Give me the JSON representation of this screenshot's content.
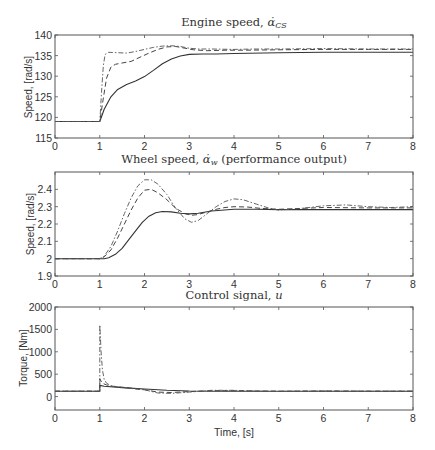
{
  "figure": {
    "xlabel": "Time, [s]"
  },
  "chart_data": [
    {
      "type": "line",
      "title": "Engine speed, α̇_CS",
      "title_main": "Engine speed, ",
      "title_symbol": "α̇",
      "title_sub": "CS",
      "xlabel": "",
      "ylabel": "Speed, [rad/s]",
      "xlim": [
        0,
        8
      ],
      "ylim": [
        115,
        140
      ],
      "xticks": [
        0,
        1,
        2,
        3,
        4,
        5,
        6,
        7,
        8
      ],
      "yticks": [
        115,
        120,
        125,
        130,
        135,
        140
      ],
      "grid": false,
      "legend": "none",
      "series": [
        {
          "name": "solid",
          "style": "solid",
          "x": [
            0,
            1.0,
            1.1,
            1.25,
            1.4,
            1.6,
            1.8,
            2.0,
            2.2,
            2.4,
            2.6,
            2.8,
            3.0,
            3.3,
            3.6,
            4.0,
            5.0,
            6.0,
            7.0,
            8.0
          ],
          "y": [
            119,
            119,
            122,
            125,
            126.8,
            128,
            128.8,
            129.9,
            131.4,
            133.0,
            134.2,
            134.9,
            135.3,
            135.4,
            135.4,
            135.5,
            135.7,
            135.8,
            135.8,
            135.8
          ]
        },
        {
          "name": "dashed",
          "style": "dashed",
          "x": [
            0,
            1.0,
            1.07,
            1.15,
            1.25,
            1.35,
            1.5,
            1.7,
            1.9,
            2.1,
            2.3,
            2.5,
            2.7,
            2.9,
            3.1,
            3.4,
            3.8,
            4.2,
            5.0,
            6.0,
            7.0,
            8.0
          ],
          "y": [
            119,
            119,
            124,
            129.5,
            132.2,
            132.9,
            133.2,
            133.6,
            134.6,
            135.6,
            136.5,
            137.1,
            137.2,
            136.8,
            136.4,
            136.2,
            136.3,
            136.3,
            136.4,
            136.5,
            136.5,
            136.5
          ]
        },
        {
          "name": "dash-dot",
          "style": "dashdot",
          "x": [
            0,
            1.0,
            1.04,
            1.08,
            1.12,
            1.2,
            1.4,
            1.6,
            1.8,
            2.0,
            2.2,
            2.4,
            2.6,
            2.8,
            3.0,
            3.2,
            3.5,
            4.0,
            4.5,
            5.0,
            6.0,
            7.0,
            8.0
          ],
          "y": [
            119,
            119,
            126,
            132.5,
            135.3,
            135.8,
            135.7,
            135.6,
            136.0,
            136.5,
            137.0,
            137.3,
            137.4,
            137.2,
            136.8,
            136.6,
            136.6,
            136.5,
            136.6,
            136.6,
            136.7,
            136.6,
            136.6
          ]
        }
      ]
    },
    {
      "type": "line",
      "title": "Wheel speed, α̇_w (performance output)",
      "title_main": "Wheel speed, ",
      "title_symbol": "α̇",
      "title_sub": "w",
      "title_tail": " (performance output)",
      "xlabel": "",
      "ylabel": "Speed, [rad/s]",
      "xlim": [
        0,
        8
      ],
      "ylim": [
        1.9,
        2.5
      ],
      "xticks": [
        0,
        1,
        2,
        3,
        4,
        5,
        6,
        7,
        8
      ],
      "yticks": [
        1.9,
        2,
        2.1,
        2.2,
        2.3,
        2.4
      ],
      "ytick_labels": [
        "1.9",
        "2",
        "2.1",
        "2.2",
        "2.3",
        "2.4"
      ],
      "grid": false,
      "legend": "none",
      "series": [
        {
          "name": "solid",
          "style": "solid",
          "x": [
            0,
            1.0,
            1.1,
            1.2,
            1.35,
            1.5,
            1.65,
            1.8,
            1.95,
            2.1,
            2.25,
            2.4,
            2.6,
            2.8,
            3.0,
            3.2,
            3.5,
            4.0,
            4.5,
            5.0,
            6.0,
            7.0,
            8.0
          ],
          "y": [
            2.0,
            2.0,
            2.0,
            2.005,
            2.025,
            2.06,
            2.11,
            2.16,
            2.21,
            2.245,
            2.265,
            2.272,
            2.27,
            2.262,
            2.258,
            2.262,
            2.275,
            2.285,
            2.285,
            2.283,
            2.283,
            2.283,
            2.283
          ]
        },
        {
          "name": "dashed",
          "style": "dashed",
          "x": [
            0,
            1.0,
            1.1,
            1.25,
            1.4,
            1.55,
            1.7,
            1.85,
            2.0,
            2.15,
            2.3,
            2.5,
            2.7,
            2.9,
            3.05,
            3.2,
            3.4,
            3.6,
            3.8,
            4.0,
            4.3,
            4.6,
            5.0,
            5.5,
            6.0,
            7.0,
            8.0
          ],
          "y": [
            2.0,
            2.0,
            2.01,
            2.05,
            2.12,
            2.2,
            2.28,
            2.35,
            2.395,
            2.4,
            2.38,
            2.34,
            2.29,
            2.26,
            2.25,
            2.255,
            2.27,
            2.285,
            2.295,
            2.3,
            2.298,
            2.29,
            2.285,
            2.29,
            2.295,
            2.293,
            2.293
          ]
        },
        {
          "name": "dash-dot",
          "style": "dashdot",
          "x": [
            0,
            1.0,
            1.1,
            1.25,
            1.4,
            1.55,
            1.7,
            1.85,
            2.0,
            2.15,
            2.3,
            2.5,
            2.7,
            2.9,
            3.05,
            3.2,
            3.4,
            3.6,
            3.8,
            4.0,
            4.2,
            4.5,
            4.8,
            5.0,
            5.5,
            6.0,
            6.5,
            7.0,
            7.5,
            8.0
          ],
          "y": [
            2.0,
            2.0,
            2.015,
            2.07,
            2.16,
            2.26,
            2.35,
            2.42,
            2.455,
            2.455,
            2.43,
            2.37,
            2.29,
            2.23,
            2.21,
            2.22,
            2.26,
            2.3,
            2.33,
            2.345,
            2.34,
            2.315,
            2.29,
            2.28,
            2.29,
            2.305,
            2.31,
            2.3,
            2.295,
            2.3
          ]
        }
      ]
    },
    {
      "type": "line",
      "title": "Control signal, u",
      "title_main": "Control signal, ",
      "title_symbol": "u",
      "xlabel": "Time, [s]",
      "ylabel": "Torque, [Nm]",
      "xlim": [
        0,
        8
      ],
      "ylim": [
        -300,
        2000
      ],
      "xticks": [
        0,
        1,
        2,
        3,
        4,
        5,
        6,
        7,
        8
      ],
      "yticks": [
        0,
        500,
        1000,
        1500,
        2000
      ],
      "grid": false,
      "legend": "none",
      "series": [
        {
          "name": "solid",
          "style": "solid",
          "x": [
            0,
            1.0,
            1.0,
            1.1,
            1.5,
            2.0,
            2.5,
            3.0,
            3.5,
            4.0,
            5.0,
            6.0,
            7.0,
            8.0
          ],
          "y": [
            120,
            120,
            250,
            230,
            200,
            170,
            140,
            125,
            120,
            120,
            120,
            120,
            120,
            120
          ]
        },
        {
          "name": "dashed",
          "style": "dashed",
          "x": [
            0,
            1.0,
            1.0,
            1.05,
            1.15,
            1.3,
            1.6,
            2.0,
            2.3,
            2.6,
            3.0,
            3.5,
            4.0,
            5.0,
            6.0,
            7.0,
            8.0
          ],
          "y": [
            120,
            120,
            400,
            300,
            260,
            230,
            200,
            150,
            100,
            90,
            110,
            130,
            130,
            120,
            125,
            120,
            120
          ]
        },
        {
          "name": "dash-dot",
          "style": "dashdot",
          "x": [
            0,
            1.0,
            1.0,
            1.03,
            1.06,
            1.1,
            1.15,
            1.25,
            1.5,
            2.0,
            2.3,
            2.6,
            3.0,
            3.5,
            4.0,
            4.5,
            5.0,
            6.0,
            7.0,
            8.0
          ],
          "y": [
            120,
            120,
            1600,
            1000,
            600,
            380,
            300,
            240,
            200,
            150,
            80,
            70,
            100,
            140,
            140,
            120,
            115,
            125,
            120,
            120
          ]
        }
      ]
    }
  ]
}
